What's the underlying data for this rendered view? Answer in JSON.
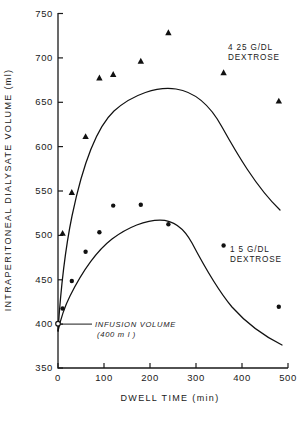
{
  "chart_data": {
    "type": "line",
    "title": "",
    "xlabel": "DWELL TIME (min)",
    "ylabel": "INTRAPERITONEAL DIALYSATE VOLUME (ml)",
    "xlim": [
      0,
      500
    ],
    "ylim": [
      350,
      750
    ],
    "xticks": [
      0,
      100,
      200,
      300,
      400,
      500
    ],
    "yticks": [
      350,
      400,
      450,
      500,
      550,
      600,
      650,
      700,
      750
    ],
    "xtick_labels": [
      "0",
      "100",
      "200",
      "300",
      "400",
      "500"
    ],
    "ytick_labels": [
      "350",
      "400",
      "450",
      "500",
      "550",
      "600",
      "650",
      "700",
      "750"
    ],
    "grid": false,
    "legend_position": "inline-right",
    "series": [
      {
        "name": "4 25 G/DL DEXTROSE",
        "marker": "triangle",
        "label_line1": "4 25 G/DL",
        "label_line2": "DEXTROSE",
        "x": [
          10,
          30,
          60,
          90,
          120,
          180,
          240,
          360,
          480
        ],
        "values": [
          502,
          548,
          611,
          677,
          681,
          696,
          728,
          683,
          651
        ]
      },
      {
        "name": "1 5 G/DL DEXTROSE",
        "marker": "circle",
        "label_line1": "1 5 G/DL",
        "label_line2": "DEXTROSE",
        "x": [
          10,
          30,
          60,
          90,
          120,
          180,
          240,
          360,
          480
        ],
        "values": [
          417,
          448,
          481,
          503,
          533,
          534,
          512,
          488,
          419
        ]
      }
    ],
    "annotations": [
      {
        "name": "infusion-volume",
        "line1": "INFUSION VOLUME",
        "line2": "(400 m l )",
        "x": 0,
        "y": 400,
        "marker": "open-circle"
      }
    ]
  },
  "axes": {
    "y_title": "INTRAPERITONEAL  DIALYSATE  VOLUME  (ml)",
    "x_title": "DWELL TIME (min)"
  },
  "colors": {
    "ink": "#111111",
    "background": "#ffffff"
  }
}
